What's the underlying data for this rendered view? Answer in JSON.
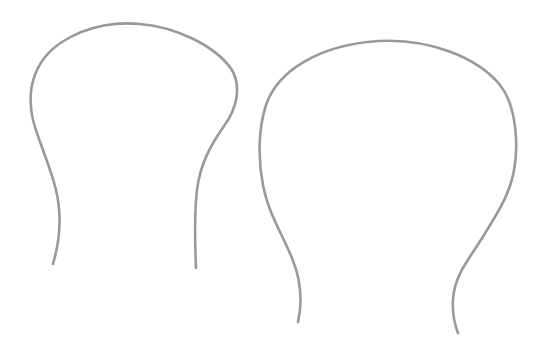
{
  "canvas": {
    "width": 539,
    "height": 355,
    "background": "#ffffff"
  },
  "style": {
    "stroke_color": "#999999",
    "stroke_width": 2.6
  },
  "shapes": [
    {
      "name": "left-bell-outline",
      "path": "M 53 264 C 60 240, 62 215, 56 190 C 50 165, 38 140, 33 120 C 26 90, 34 60, 62 42 C 90 24, 120 22, 140 24 C 175 27, 215 45, 232 70 C 242 88, 236 110, 224 126 C 210 146, 200 165, 197 190 C 194 215, 195 245, 196 268"
    },
    {
      "name": "right-bell-outline",
      "path": "M 298 322 C 303 300, 301 280, 292 258 C 282 234, 268 212, 263 185 C 258 160, 258 130, 266 105 C 278 70, 320 45, 378 41 C 430 38, 478 58, 500 85 C 518 108, 518 150, 514 170 C 510 195, 496 215, 484 235 C 470 258, 454 275, 453 300 C 452 315, 455 325, 458 333"
    }
  ]
}
